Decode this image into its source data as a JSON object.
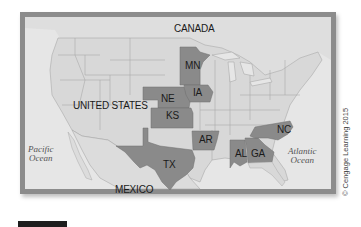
{
  "map": {
    "country_labels": {
      "canada": "CANADA",
      "united_states": "UNITED STATES",
      "mexico": "MEXICO"
    },
    "ocean_labels": {
      "pacific_line1": "Pacific",
      "pacific_line2": "Ocean",
      "atlantic_line1": "Atlantic",
      "atlantic_line2": "Ocean"
    },
    "highlighted_states": [
      "MN",
      "IA",
      "NE",
      "KS",
      "AR",
      "TX",
      "AL",
      "GA",
      "NC"
    ],
    "state_labels": {
      "mn": "MN",
      "ia": "IA",
      "ne": "NE",
      "ks": "KS",
      "ar": "AR",
      "tx": "TX",
      "al": "AL",
      "ga": "GA",
      "nc": "NC"
    },
    "colors": {
      "highlight": "#8a8a8a",
      "land": "#dadada",
      "ocean": "#e8e8e8",
      "frame": "#8c8c8c",
      "border_lines": "#9a9a9a"
    }
  },
  "credit": "© Cengage Learning 2015"
}
